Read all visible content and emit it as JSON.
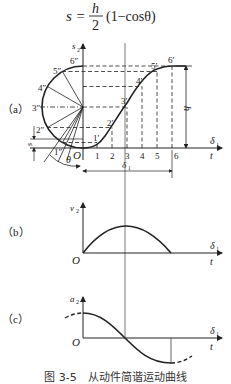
{
  "formula": {
    "lhs": "s =",
    "numerator": "h",
    "denominator": "2",
    "rhs": "(1−cosθ)"
  },
  "panels": {
    "a": {
      "tag": "（a）",
      "y_axis_label": "s",
      "y_axis_sub": "2",
      "x_axis_label_top": "δ",
      "x_axis_label_top_sub": "1",
      "x_axis_label_bottom": "t",
      "origin": "O",
      "circle_points": [
        "1″",
        "2″",
        "3″",
        "4″",
        "5″",
        "6″"
      ],
      "curve_points": [
        "1′",
        "2′",
        "3′",
        "4′",
        "5′",
        "6′"
      ],
      "ticks": [
        "1",
        "2",
        "3",
        "4",
        "5",
        "6"
      ],
      "h_label": "h",
      "s_label": "s",
      "s_sub": "2",
      "theta_label": "θ",
      "delta_label": "δ",
      "delta_sub": "1"
    },
    "b": {
      "tag": "（b）",
      "y_axis_label": "v",
      "y_axis_sub": "2",
      "x_axis_label_top": "δ",
      "x_axis_label_top_sub": "1",
      "x_axis_label_bottom": "t",
      "origin": "O"
    },
    "c": {
      "tag": "（c）",
      "y_axis_label": "a",
      "y_axis_sub": "2",
      "x_axis_label_top": "δ",
      "x_axis_label_top_sub": "1",
      "x_axis_label_bottom": "t",
      "origin": "O"
    }
  },
  "caption": "图 3-5　从动件简谐运动曲线",
  "colors": {
    "line": "#222222",
    "background": "#ffffff"
  }
}
